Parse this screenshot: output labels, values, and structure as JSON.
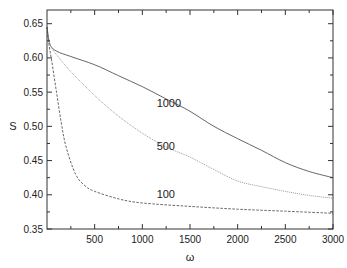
{
  "chart_data": {
    "type": "line",
    "title": "",
    "xlabel": "ω",
    "ylabel": "S",
    "xlim": [
      0,
      3000
    ],
    "ylim": [
      0.35,
      0.67
    ],
    "grid": false,
    "legend": "inline curve labels",
    "xticks": [
      500,
      1000,
      1500,
      2000,
      2500,
      3000
    ],
    "yticks": [
      0.35,
      0.4,
      0.45,
      0.5,
      0.55,
      0.6,
      0.65
    ],
    "ytick_labels": [
      "0.35",
      "0.40",
      "0.45",
      "0.50",
      "0.55",
      "0.60",
      "0.65"
    ],
    "series": [
      {
        "name": "1000",
        "style": "solid",
        "color": "#555555",
        "x": [
          0,
          30,
          100,
          250,
          500,
          750,
          1000,
          1250,
          1500,
          1750,
          2000,
          2250,
          2500,
          2750,
          3000
        ],
        "y": [
          0.645,
          0.62,
          0.61,
          0.602,
          0.59,
          0.574,
          0.558,
          0.54,
          0.522,
          0.5,
          0.482,
          0.465,
          0.447,
          0.434,
          0.425
        ],
        "label_pos": [
          1150,
          0.528
        ]
      },
      {
        "name": "500",
        "style": "dotted",
        "color": "#999999",
        "x": [
          0,
          30,
          100,
          250,
          500,
          750,
          1000,
          1250,
          1500,
          1750,
          2000,
          2250,
          2500,
          2750,
          3000
        ],
        "y": [
          0.645,
          0.62,
          0.605,
          0.58,
          0.545,
          0.515,
          0.49,
          0.47,
          0.455,
          0.437,
          0.42,
          0.412,
          0.405,
          0.399,
          0.395
        ],
        "label_pos": [
          1150,
          0.465
        ]
      },
      {
        "name": "100",
        "style": "dashed",
        "color": "#666666",
        "x": [
          0,
          20,
          50,
          100,
          150,
          200,
          300,
          400,
          500,
          750,
          1000,
          1500,
          2000,
          2500,
          3000
        ],
        "y": [
          0.645,
          0.62,
          0.595,
          0.55,
          0.505,
          0.47,
          0.43,
          0.413,
          0.405,
          0.394,
          0.388,
          0.383,
          0.379,
          0.376,
          0.373
        ],
        "label_pos": [
          1150,
          0.395
        ]
      }
    ]
  }
}
